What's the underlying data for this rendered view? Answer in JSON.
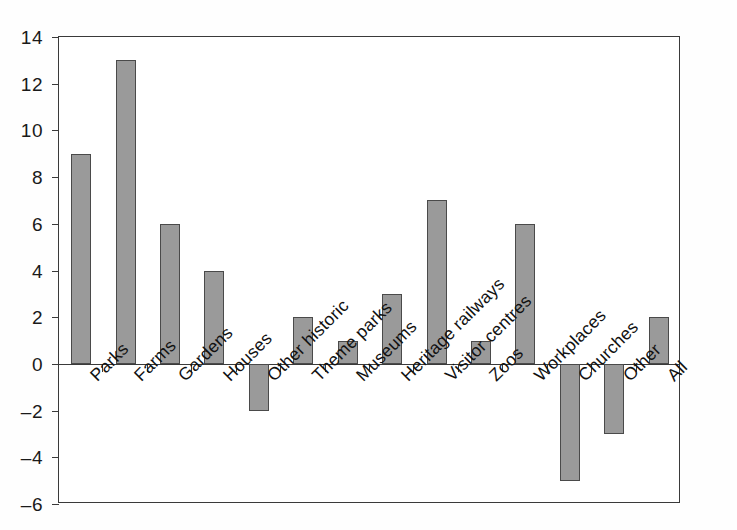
{
  "chart_data": {
    "type": "bar",
    "title": "",
    "subtitle": "",
    "xlabel": "",
    "ylabel": "",
    "ylim": [
      -6,
      14
    ],
    "ytick_step": 2,
    "yticks": [
      "14",
      "12",
      "10",
      "8",
      "6",
      "4",
      "2",
      "0",
      "–2",
      "–4",
      "–6"
    ],
    "ytick_values": [
      14,
      12,
      10,
      8,
      6,
      4,
      2,
      0,
      -2,
      -4,
      -6
    ],
    "grid": false,
    "legend": null,
    "categories": [
      "Parks",
      "Farms",
      "Gardens",
      "Houses",
      "Other historic",
      "Theme parks",
      "Museums",
      "Heritage railways",
      "Visitor centres",
      "Zoos",
      "Workplaces",
      "Churches",
      "Other",
      "All"
    ],
    "values": [
      9,
      13,
      6,
      4,
      -2,
      2,
      1,
      3,
      7,
      1,
      6,
      -5,
      -3,
      2
    ],
    "bar_color": "#9a9a9a",
    "bar_border_color": "#4a4a4a",
    "axis_color": "#3a3a3a",
    "label_rotation_deg": -45
  }
}
